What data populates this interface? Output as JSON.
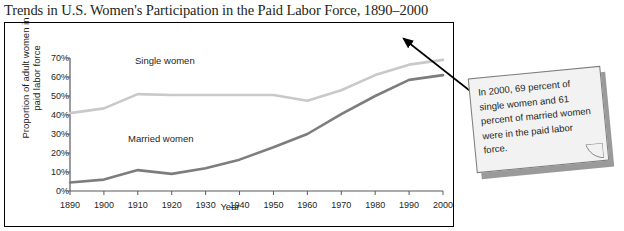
{
  "chart_data": {
    "type": "line",
    "title": "Trends in U.S. Women's Participation in the Paid Labor Force, 1890–2000",
    "xlabel": "Year",
    "ylabel": "Proportion of adult women in paid labor force",
    "x": [
      1890,
      1900,
      1910,
      1920,
      1930,
      1940,
      1950,
      1960,
      1970,
      1980,
      1990,
      2000
    ],
    "xtick_labels": [
      "1890",
      "1900",
      "1910",
      "1920",
      "1930",
      "1940",
      "1950",
      "1960",
      "1970",
      "1980",
      "1990",
      "2000"
    ],
    "ytick_labels": [
      "0%",
      "10%",
      "20%",
      "30%",
      "40%",
      "50%",
      "60%",
      "70%"
    ],
    "ytick_values": [
      0,
      10,
      20,
      30,
      40,
      50,
      60,
      70
    ],
    "xlim": [
      1890,
      2000
    ],
    "ylim": [
      0,
      70
    ],
    "grid": false,
    "legend_position": "inline-labels",
    "series": [
      {
        "name": "Single women",
        "color": "#c9c9c9",
        "values": [
          41,
          43.5,
          51,
          50.5,
          50.5,
          50.5,
          50.5,
          47.5,
          53,
          61,
          66.5,
          69
        ]
      },
      {
        "name": "Married women",
        "color": "#7d7d7d",
        "values": [
          4.5,
          6,
          11,
          9,
          12,
          16.5,
          23,
          30,
          40.5,
          50,
          58.5,
          61
        ]
      }
    ],
    "annotation": {
      "text": "In 2000, 69 percent of single women and 61 percent of married women were in the paid labor force.",
      "points_to_year": 2000,
      "points_to_series": "Single women"
    }
  },
  "labels": {
    "single_women": "Single women",
    "married_women": "Married women"
  }
}
